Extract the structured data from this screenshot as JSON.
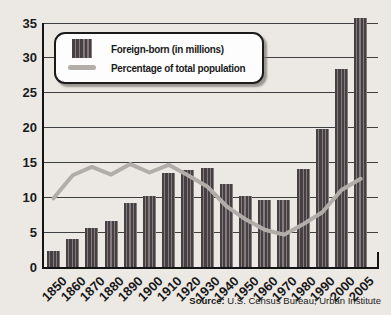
{
  "chart_data": {
    "type": "bar",
    "title": "",
    "xlabel": "",
    "ylabel": "",
    "categories": [
      "1850",
      "1860",
      "1870",
      "1880",
      "1890",
      "1900",
      "1910",
      "1920",
      "1930",
      "1940",
      "1950",
      "1960",
      "1970",
      "1980",
      "1990",
      "2000",
      "2005"
    ],
    "series": [
      {
        "name": "Foreign-born (in millions)",
        "type": "bar",
        "values": [
          2.3,
          4.1,
          5.6,
          6.7,
          9.2,
          10.3,
          13.5,
          13.9,
          14.2,
          11.9,
          10.3,
          9.7,
          9.6,
          14.1,
          19.8,
          28.4,
          35.7
        ]
      },
      {
        "name": "Percentage of total population",
        "type": "line",
        "values": [
          9.9,
          13.2,
          14.4,
          13.3,
          14.8,
          13.6,
          14.7,
          13.2,
          11.6,
          8.8,
          6.9,
          5.4,
          4.7,
          6.2,
          7.9,
          11.1,
          12.7
        ]
      }
    ],
    "ylim": [
      0,
      35
    ],
    "yticks": [
      0,
      5,
      10,
      15,
      20,
      25,
      30,
      35
    ],
    "grid": true,
    "legend_position": "top-left"
  },
  "source": {
    "label": "Source:",
    "text": " U.S. Census Bureau; Urban Institute"
  },
  "colors": {
    "background": "#ece9e4",
    "bar_dark": "#464042",
    "bar_light": "#847c7e",
    "line": "#b3adaa",
    "grid": "#3f3f3f",
    "axis": "#141414",
    "legend_bg": "#fdfdfd",
    "legend_border": "#1b1b1b",
    "text": "#1a1a1a"
  }
}
